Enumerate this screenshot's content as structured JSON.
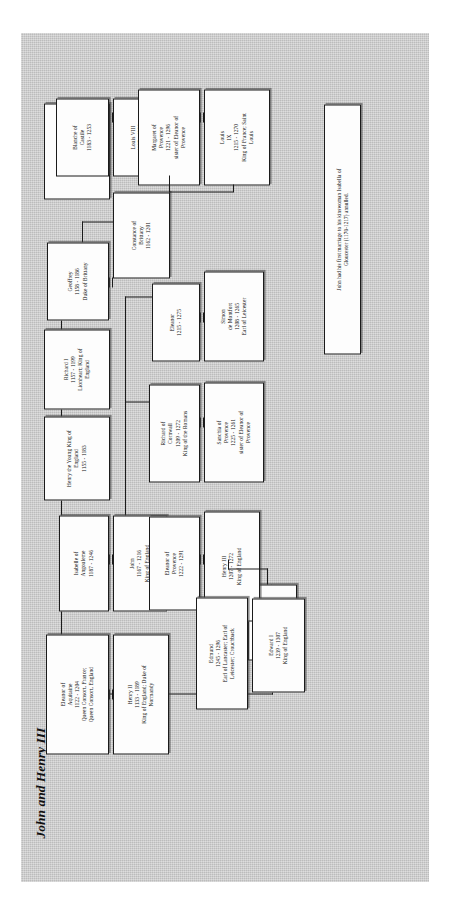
{
  "document": {
    "title": "John and Henry III",
    "type": "genealogy-chart",
    "background_color": "#c9c9c9",
    "box_fill": "#fdfdfd",
    "line_color": "#1b1b1b"
  },
  "nodes": [
    {
      "id": "henry2",
      "text": "Henry II\n1133 - 1189\nKing of England; Duke of\nNormandy"
    },
    {
      "id": "eleanor_aq",
      "text": "Eleanor of\nAquitaine\n1122 - 1204\nQueen Consort, France;\nQueen Consort, England"
    },
    {
      "id": "eleanor_cas",
      "text": "Eleanor\n1161 - 1214\nQueen of Castile"
    },
    {
      "id": "john",
      "text": "John\n1167 - 1216\nKing of England"
    },
    {
      "id": "isabelle",
      "text": "Isabelle of\nAngouleme\n1187 - 1246"
    },
    {
      "id": "henry_young",
      "text": "Henry the Young King of\nEngland\n1155 - 1183"
    },
    {
      "id": "richard1",
      "text": "Richard I\n1157 - 1199\nLionheart; King of\nEngland"
    },
    {
      "id": "geoffrey",
      "text": "Geoffrey\n1158 - 1186\nDuke of Brittany"
    },
    {
      "id": "constance",
      "text": "Constance of\nBrittany\n1162 - 1201"
    },
    {
      "id": "arthur",
      "text": "Arthur of\nBrittany\n1187 - 1203\nEarl of Richmond and\nDuke of Brittany"
    },
    {
      "id": "henry3",
      "text": "Henry III\n1207 - 1272\nKing of England"
    },
    {
      "id": "eleanor_pro",
      "text": "Eleanor of\nProvence\n1222 - 1291"
    },
    {
      "id": "richard_corn",
      "text": "Richard of\nCornwall\n1209 - 1272\nKing of the Romans"
    },
    {
      "id": "sanchia",
      "text": "Sanchia of\nProvence\n1225 - 1261\nsister of Eleanor of\nProvence"
    },
    {
      "id": "eleanor_sim",
      "text": "Eleanor\n1215 - 1275"
    },
    {
      "id": "simon",
      "text": "Simon\nde Montfort\n1208 - 1265\nEarl of Leicester"
    },
    {
      "id": "edward1",
      "text": "Edward I\n1239 - 1307\nKing of England"
    },
    {
      "id": "edmund",
      "text": "Edmund\n1245 - 1296\nEarl of Lancaster; Earl of\nLeicester; Crouchback"
    },
    {
      "id": "louis8",
      "text": "Louis VIII\n1187 - 1226\nKing of France"
    },
    {
      "id": "blanche",
      "text": "Blanche of\nCastile\n1183 - 1253"
    },
    {
      "id": "louis9",
      "text": "Louis\nIX\n1215 - 1270\nKing of France; Saint\nLouis"
    },
    {
      "id": "margaret",
      "text": "Margaret of\nProvence\n1221 - 1296\nsister of Eleanor of\nProvence"
    },
    {
      "id": "footnote",
      "text": "John had his first marriage to his kinswoman Isabella of\nGloucester (1170-1217) annulled."
    }
  ]
}
